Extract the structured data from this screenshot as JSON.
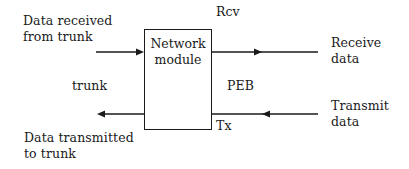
{
  "diagram": {
    "module": {
      "line1": "Network",
      "line2": "module"
    },
    "labels": {
      "data_received_line1": "Data received",
      "data_received_line2": "from trunk",
      "trunk": "trunk",
      "data_transmitted_line1": "Data transmitted",
      "data_transmitted_line2": "to trunk",
      "rcv": "Rcv",
      "peb": "PEB",
      "tx": "Tx",
      "receive_data_line1": "Receive",
      "receive_data_line2": "data",
      "transmit_data_line1": "Transmit",
      "transmit_data_line2": "data"
    },
    "arrows": [
      {
        "name": "trunk-in",
        "from": "Data received from trunk",
        "to": "Network module",
        "direction": "right"
      },
      {
        "name": "receive-out",
        "from": "Network module",
        "to": "Receive data",
        "direction": "right"
      },
      {
        "name": "transmit-in",
        "from": "Transmit data",
        "to": "Network module",
        "direction": "left"
      },
      {
        "name": "trunk-out",
        "from": "Network module",
        "to": "Data transmitted to trunk",
        "direction": "left"
      }
    ],
    "colors": {
      "line": "#1a1a1a",
      "background": "#ffffff"
    }
  }
}
